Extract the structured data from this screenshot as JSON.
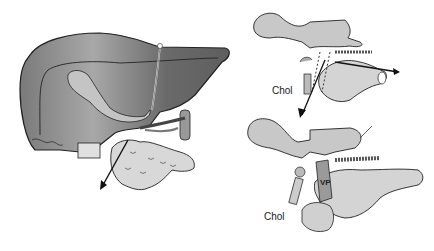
{
  "figure": {
    "panels": [
      {
        "id": "left",
        "subject": "liver-with-pancreas-duodenum",
        "arrow": "double-headed-arrow"
      },
      {
        "id": "top-right",
        "subject": "pancreas-duodenum-top-view",
        "label": "Chol"
      },
      {
        "id": "bottom-right",
        "subject": "pancreas-duodenum-bottom-view",
        "labels": [
          "Chol",
          "VP"
        ]
      }
    ],
    "labels": {
      "top_right_chol": "Chol",
      "bottom_right_chol": "Chol",
      "bottom_right_vp": "VP"
    },
    "colors": {
      "liver_dark": "#6e6e6e",
      "liver_mid": "#9a9a9a",
      "liver_light": "#c8c8c8",
      "organ_light": "#d4d4d4",
      "outline": "#222222",
      "background": "#ffffff"
    }
  }
}
